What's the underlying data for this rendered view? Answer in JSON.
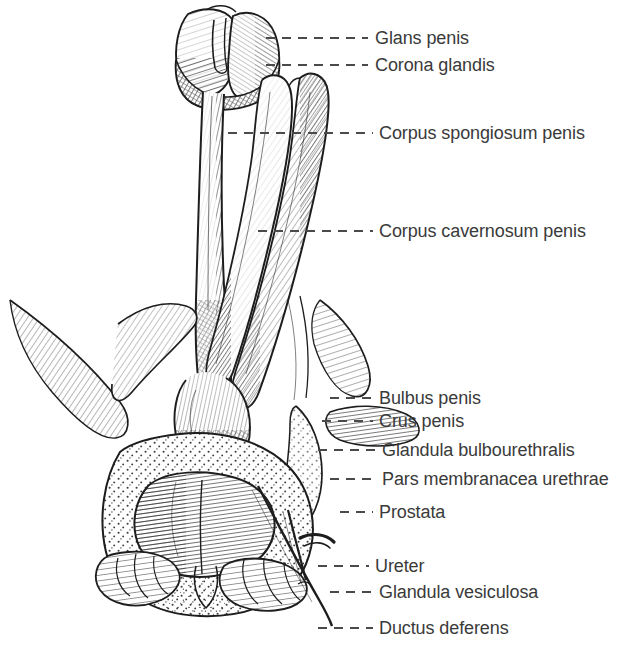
{
  "plate": {
    "kind": "anatomical-illustration",
    "style": "engraving-hatched-line-drawing",
    "subject": "Male genital organs, posterior view of penis, prostate and seminal vesicles",
    "background_color": "#ffffff",
    "ink_color": "#1d1d1d",
    "text_color": "#3a3a3a",
    "leader_color": "#4a4a4a",
    "width": 641,
    "height": 651
  },
  "labels": [
    {
      "id": "glans-penis",
      "text": "Glans penis",
      "text_x": 375,
      "text_y": 29,
      "line_y": 38,
      "line_x1": 266,
      "line_x2": 368
    },
    {
      "id": "corona-glandis",
      "text": "Corona glandis",
      "text_x": 375,
      "text_y": 56,
      "line_y": 65,
      "line_x1": 266,
      "line_x2": 368
    },
    {
      "id": "corpus-spongiosum-penis",
      "text": "Corpus spongiosum penis",
      "text_x": 379,
      "text_y": 124,
      "line_y": 133,
      "line_x1": 228,
      "line_x2": 373
    },
    {
      "id": "corpus-cavernosum-penis",
      "text": "Corpus cavernosum penis",
      "text_x": 379,
      "text_y": 222,
      "line_y": 231,
      "line_x1": 258,
      "line_x2": 373
    },
    {
      "id": "bulbus-penis",
      "text": "Bulbus penis",
      "text_x": 379,
      "text_y": 389,
      "line_y": 398,
      "line_x1": 330,
      "line_x2": 373
    },
    {
      "id": "crus-penis",
      "text": "Crus penis",
      "text_x": 379,
      "text_y": 412,
      "line_y": 421,
      "line_x1": 322,
      "line_x2": 373
    },
    {
      "id": "glandula-bulbourethralis",
      "text": "Glandula bulbourethralis",
      "text_x": 382,
      "text_y": 441,
      "line_y": 450,
      "line_x1": 318,
      "line_x2": 375
    },
    {
      "id": "pars-membranacea-urethrae",
      "text": "Pars membranacea urethrae",
      "text_x": 382,
      "text_y": 470,
      "line_y": 479,
      "line_x1": 330,
      "line_x2": 375
    },
    {
      "id": "prostata",
      "text": "Prostata",
      "text_x": 379,
      "text_y": 503,
      "line_y": 512,
      "line_x1": 340,
      "line_x2": 373
    },
    {
      "id": "ureter",
      "text": "Ureter",
      "text_x": 375,
      "text_y": 557,
      "line_y": 566,
      "line_x1": 318,
      "line_x2": 369
    },
    {
      "id": "glandula-vesiculosa",
      "text": "Glandula vesiculosa",
      "text_x": 379,
      "text_y": 583,
      "line_y": 592,
      "line_x1": 330,
      "line_x2": 373
    },
    {
      "id": "ductus-deferens",
      "text": "Ductus deferens",
      "text_x": 379,
      "text_y": 619,
      "line_y": 628,
      "line_x1": 318,
      "line_x2": 373
    }
  ]
}
